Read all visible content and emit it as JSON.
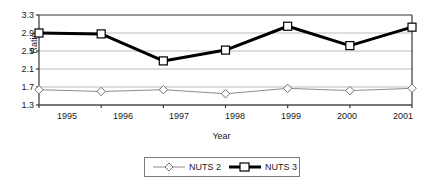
{
  "chart_data": {
    "type": "line",
    "title": "",
    "xlabel": "Year",
    "ylabel": "Ratio",
    "categories": [
      "1995",
      "1996",
      "1997",
      "1998",
      "1999",
      "2000",
      "2001"
    ],
    "x": [
      1995,
      1996,
      1997,
      1998,
      1999,
      2000,
      2001
    ],
    "series": [
      {
        "name": "NUTS 2",
        "values": [
          1.64,
          1.6,
          1.64,
          1.55,
          1.67,
          1.62,
          1.67
        ],
        "marker": "diamond",
        "color": "#8c8c8c",
        "line_width": 1
      },
      {
        "name": "NUTS 3",
        "values": [
          2.9,
          2.88,
          2.28,
          2.52,
          3.05,
          2.62,
          3.03
        ],
        "marker": "square",
        "color": "#000000",
        "line_width": 3
      }
    ],
    "ylim": [
      1.3,
      3.3
    ],
    "yticks": [
      "1.3",
      "1.7",
      "2.1",
      "2.5",
      "2.9",
      "3.3"
    ],
    "ytick_values": [
      1.3,
      1.7,
      2.1,
      2.5,
      2.9,
      3.3
    ],
    "xticks": [
      "1995",
      "1996",
      "1997",
      "1998",
      "1999",
      "2000",
      "2001"
    ],
    "grid": "horizontal",
    "grid_color": "#aaaaaa",
    "legend_position": "bottom-center",
    "legend_entries": [
      "NUTS 2",
      "NUTS 3"
    ],
    "plot_border_color": "#555555",
    "background": "#ffffff"
  }
}
